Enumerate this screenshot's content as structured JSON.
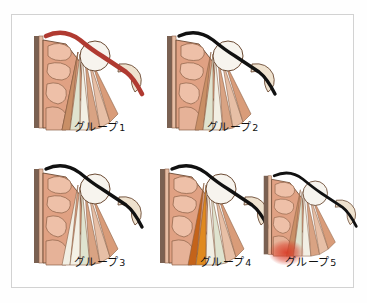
{
  "figure": {
    "title": "",
    "type": "anatomical-cross-section-classification",
    "background_color": "#ffffff",
    "frame_color": "#d2d2d2",
    "panel_count": 5
  },
  "palette": {
    "flesh": "#e0a183",
    "flesh_light": "#eec0a8",
    "flesh_dark": "#cf8a6b",
    "outline": "#5a3a28",
    "bone_white": "#f7f4ee",
    "bone_outline": "#6b4a33",
    "cortex_gray": "#7a6152",
    "tendon_white": "#f2efe4",
    "tendon_green": "#dfe3cf",
    "tendon_tan": "#c98f66",
    "black_line": "#111111",
    "red_line": "#b03a31",
    "orange_fiber": "#e08a1e",
    "amber_fiber": "#c4631a",
    "red_blush": "#d93b27"
  },
  "panels": [
    {
      "id": "group-1",
      "label": "グループ",
      "number": "1",
      "highlight": "thick red outer contour along the superior border",
      "highlight_color": "#b03a31"
    },
    {
      "id": "group-2",
      "label": "グループ",
      "number": "2",
      "highlight": "normal black outer contour",
      "highlight_color": "#111111"
    },
    {
      "id": "group-3",
      "label": "グループ",
      "number": "3",
      "highlight": "pale whitened fibers in mid fan",
      "highlight_color": "#f2efe4"
    },
    {
      "id": "group-4",
      "label": "グループ",
      "number": "4",
      "highlight": "orange and amber highlighted fibers",
      "highlight_color": "#e08a1e"
    },
    {
      "id": "group-5",
      "label": "グループ",
      "number": "5",
      "highlight": "red inflamed blush at the inferior tip",
      "highlight_color": "#d93b27"
    }
  ]
}
